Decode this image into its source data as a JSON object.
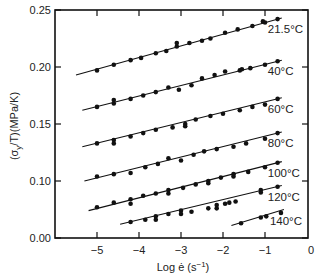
{
  "chart_data": {
    "type": "scatter",
    "title": "",
    "xlabel": "Log ė (s⁻¹)",
    "ylabel": "(σy/T)(MPa/K)",
    "xlim": [
      -6,
      0
    ],
    "ylim": [
      0.05,
      0.25
    ],
    "y_axis_break": "axis jumps from 0.10 to 0.00 (broken axis)",
    "x_ticks": [
      -5,
      -4,
      -3,
      -2,
      -1,
      0
    ],
    "y_ticks": [
      {
        "value": 0.25,
        "label": "0.25"
      },
      {
        "value": 0.2,
        "label": "0.20"
      },
      {
        "value": 0.15,
        "label": "0.15"
      },
      {
        "value": 0.1,
        "label": "0.10"
      },
      {
        "value": 0.05,
        "label": "0.00"
      }
    ],
    "grid": false,
    "legend": "inline labels at right end of each line",
    "series": [
      {
        "name": "21.5°C",
        "line": [
          [
            -5.5,
            0.193
          ],
          [
            -0.6,
            0.243
          ]
        ],
        "points": [
          [
            -5.0,
            0.197
          ],
          [
            -4.6,
            0.202
          ],
          [
            -4.2,
            0.206
          ],
          [
            -3.95,
            0.208
          ],
          [
            -3.6,
            0.212
          ],
          [
            -3.35,
            0.214
          ],
          [
            -3.1,
            0.218
          ],
          [
            -3.1,
            0.221
          ],
          [
            -2.8,
            0.221
          ],
          [
            -2.5,
            0.223
          ],
          [
            -2.3,
            0.225
          ],
          [
            -1.95,
            0.23
          ],
          [
            -1.65,
            0.233
          ],
          [
            -1.3,
            0.236
          ],
          [
            -1.05,
            0.24
          ],
          [
            -1.0,
            0.239
          ],
          [
            -0.7,
            0.242
          ]
        ]
      },
      {
        "name": "40°C",
        "line": [
          [
            -5.35,
            0.162
          ],
          [
            -0.6,
            0.206
          ]
        ],
        "points": [
          [
            -5.0,
            0.165
          ],
          [
            -4.6,
            0.168
          ],
          [
            -4.6,
            0.171
          ],
          [
            -4.2,
            0.172
          ],
          [
            -3.9,
            0.175
          ],
          [
            -3.6,
            0.178
          ],
          [
            -3.3,
            0.182
          ],
          [
            -3.05,
            0.18
          ],
          [
            -2.75,
            0.184
          ],
          [
            -2.5,
            0.19
          ],
          [
            -2.2,
            0.193
          ],
          [
            -1.95,
            0.196
          ],
          [
            -1.6,
            0.197
          ],
          [
            -1.55,
            0.198
          ],
          [
            -1.35,
            0.199
          ],
          [
            -1.0,
            0.202
          ],
          [
            -0.7,
            0.205
          ]
        ]
      },
      {
        "name": "60°C",
        "line": [
          [
            -5.35,
            0.13
          ],
          [
            -0.6,
            0.173
          ]
        ],
        "points": [
          [
            -5.0,
            0.133
          ],
          [
            -4.6,
            0.136
          ],
          [
            -4.6,
            0.133
          ],
          [
            -4.2,
            0.139
          ],
          [
            -3.9,
            0.142
          ],
          [
            -3.6,
            0.145
          ],
          [
            -3.2,
            0.147
          ],
          [
            -2.9,
            0.15
          ],
          [
            -2.9,
            0.148
          ],
          [
            -2.65,
            0.154
          ],
          [
            -2.3,
            0.157
          ],
          [
            -2.0,
            0.159
          ],
          [
            -1.6,
            0.162
          ],
          [
            -1.3,
            0.165
          ],
          [
            -1.0,
            0.167
          ],
          [
            -0.7,
            0.172
          ]
        ]
      },
      {
        "name": "80°C",
        "line": [
          [
            -5.3,
            0.1
          ],
          [
            -0.6,
            0.143
          ]
        ],
        "points": [
          [
            -5.0,
            0.104
          ],
          [
            -4.6,
            0.106
          ],
          [
            -4.2,
            0.107
          ],
          [
            -3.85,
            0.112
          ],
          [
            -3.55,
            0.115
          ],
          [
            -3.3,
            0.12
          ],
          [
            -3.0,
            0.118
          ],
          [
            -2.7,
            0.123
          ],
          [
            -2.45,
            0.126
          ],
          [
            -2.15,
            0.128
          ],
          [
            -1.75,
            0.13
          ],
          [
            -1.45,
            0.133
          ],
          [
            -1.0,
            0.137
          ],
          [
            -0.7,
            0.142
          ]
        ]
      },
      {
        "name": "100°C",
        "line": [
          [
            -5.2,
            0.074
          ],
          [
            -0.6,
            0.117
          ]
        ],
        "points": [
          [
            -5.0,
            0.077
          ],
          [
            -4.6,
            0.081
          ],
          [
            -4.2,
            0.084
          ],
          [
            -4.2,
            0.08
          ],
          [
            -3.9,
            0.087
          ],
          [
            -3.6,
            0.089
          ],
          [
            -3.3,
            0.092
          ],
          [
            -3.3,
            0.089
          ],
          [
            -2.95,
            0.094
          ],
          [
            -2.65,
            0.097
          ],
          [
            -2.35,
            0.1
          ],
          [
            -2.35,
            0.098
          ],
          [
            -2.05,
            0.103
          ],
          [
            -1.75,
            0.106
          ],
          [
            -1.75,
            0.104
          ],
          [
            -1.4,
            0.108
          ],
          [
            -1.0,
            0.112
          ],
          [
            -0.7,
            0.116
          ]
        ]
      },
      {
        "name": "120°C",
        "line": [
          [
            -4.45,
            0.062
          ],
          [
            -0.6,
            0.096
          ]
        ],
        "points": [
          [
            -4.2,
            0.064
          ],
          [
            -3.85,
            0.066
          ],
          [
            -3.6,
            0.069
          ],
          [
            -3.6,
            0.066
          ],
          [
            -3.3,
            0.071
          ],
          [
            -3.0,
            0.074
          ],
          [
            -3.0,
            0.071
          ],
          [
            -2.75,
            0.073
          ],
          [
            -2.35,
            0.076
          ],
          [
            -2.15,
            0.079
          ],
          [
            -2.15,
            0.076
          ],
          [
            -1.95,
            0.08
          ],
          [
            -1.85,
            0.081
          ],
          [
            -1.7,
            0.082
          ],
          [
            -1.1,
            0.092
          ],
          [
            -1.1,
            0.09
          ],
          [
            -0.7,
            0.095
          ]
        ]
      },
      {
        "name": "140°C",
        "line": [
          [
            -1.8,
            0.061
          ],
          [
            -0.55,
            0.075
          ]
        ],
        "points": [
          [
            -1.57,
            0.063
          ],
          [
            -1.1,
            0.068
          ],
          [
            -0.97,
            0.069
          ],
          [
            -0.62,
            0.072
          ]
        ]
      }
    ]
  },
  "labels": {
    "xlabel_main": "Log ė (s",
    "xlabel_sup": "−1",
    "xlabel_close": ")",
    "ylabel": "(σ/T)(MPa/K)",
    "ylabel_sub": "y"
  }
}
